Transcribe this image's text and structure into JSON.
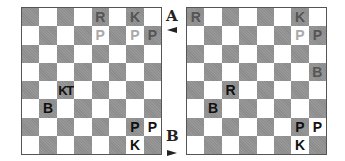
{
  "diagrams": [
    {
      "label": "A",
      "arrow": "left",
      "pieces": [
        {
          "sq": "e8",
          "text": "R",
          "color": "white"
        },
        {
          "sq": "g8",
          "text": "K",
          "color": "white"
        },
        {
          "sq": "e7",
          "text": "P",
          "color": "white"
        },
        {
          "sq": "g7",
          "text": "P",
          "color": "white"
        },
        {
          "sq": "h7",
          "text": "P",
          "color": "white"
        },
        {
          "sq": "c4",
          "text": "KT",
          "color": "black"
        },
        {
          "sq": "b3",
          "text": "B",
          "color": "black"
        },
        {
          "sq": "g2",
          "text": "P",
          "color": "black"
        },
        {
          "sq": "h2",
          "text": "P",
          "color": "black"
        },
        {
          "sq": "g1",
          "text": "K",
          "color": "black"
        }
      ]
    },
    {
      "label": "B",
      "arrow": "right",
      "pieces": [
        {
          "sq": "a8",
          "text": "R",
          "color": "white"
        },
        {
          "sq": "g8",
          "text": "K",
          "color": "white"
        },
        {
          "sq": "g7",
          "text": "P",
          "color": "white"
        },
        {
          "sq": "h7",
          "text": "P",
          "color": "white"
        },
        {
          "sq": "h5",
          "text": "B",
          "color": "white"
        },
        {
          "sq": "c4",
          "text": "R",
          "color": "black"
        },
        {
          "sq": "b3",
          "text": "B",
          "color": "black"
        },
        {
          "sq": "g2",
          "text": "P",
          "color": "black"
        },
        {
          "sq": "h2",
          "text": "P",
          "color": "black"
        },
        {
          "sq": "g1",
          "text": "K",
          "color": "black"
        }
      ]
    }
  ],
  "labels": {
    "a": "A",
    "b": "B"
  },
  "colors": {
    "dark_square": "#8c8c8c",
    "light_square": "#ffffff",
    "white_piece": "#a9a9a9",
    "black_piece": "#111111"
  }
}
